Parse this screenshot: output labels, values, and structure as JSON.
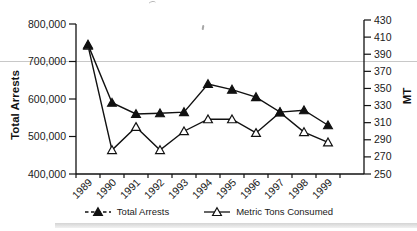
{
  "colors": {
    "line": "#111111",
    "grid": "#c8c8c8",
    "text": "#1a1a1a",
    "background": "#ffffff"
  },
  "chart_data": {
    "type": "line",
    "title": "",
    "x_categories": [
      "1989",
      "1990",
      "1991",
      "1992",
      "1993",
      "1994",
      "1995",
      "1996",
      "1997",
      "1998",
      "1999"
    ],
    "left_axis": {
      "label": "Total Arrests",
      "min": 400000,
      "max": 800000,
      "tick_values": [
        400000,
        500000,
        600000,
        700000,
        800000
      ],
      "tick_labels": [
        "400,000",
        "500,000",
        "600,000",
        "700,000",
        "800,000"
      ]
    },
    "right_axis": {
      "label": "MT",
      "min": 250,
      "max": 430,
      "tick_values": [
        250,
        270,
        290,
        310,
        330,
        350,
        370,
        390,
        410,
        430
      ]
    },
    "gridlines_left_values": [
      700000
    ],
    "legend_position": "bottom",
    "series": [
      {
        "name": "Total Arrests",
        "axis": "left",
        "marker": "filled-triangle",
        "legend_line": "dashed",
        "values": [
          745000,
          590000,
          560000,
          562000,
          565000,
          640000,
          625000,
          605000,
          565000,
          570000,
          530000
        ]
      },
      {
        "name": "Metric Tons Consumed",
        "axis": "right",
        "marker": "open-triangle",
        "legend_line": "solid",
        "values": [
          400,
          278,
          305,
          278,
          300,
          314,
          314,
          298,
          322,
          299,
          287
        ]
      }
    ]
  }
}
